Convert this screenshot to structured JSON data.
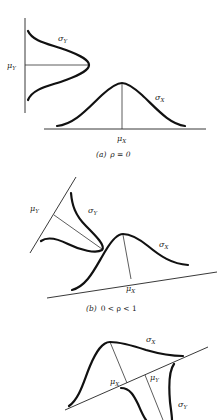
{
  "figure_a": {
    "caption_letter": "(a)",
    "caption_condition": "ρ = 0",
    "labels": {
      "mu_y": "μ",
      "mu_y_sub": "Y",
      "sigma_y": "σ",
      "sigma_y_sub": "Y",
      "mu_x": "μ",
      "mu_x_sub": "X",
      "sigma_x": "σ",
      "sigma_x_sub": "X"
    }
  },
  "figure_b": {
    "caption_letter": "(b)",
    "caption_condition": "0 < ρ < 1",
    "labels": {
      "mu_y": "μ",
      "mu_y_sub": "Y",
      "sigma_y": "σ",
      "sigma_y_sub": "Y",
      "mu_x": "μ",
      "mu_x_sub": "X",
      "sigma_x": "σ",
      "sigma_x_sub": "X"
    }
  },
  "figure_c": {
    "labels": {
      "mu_x": "μ",
      "mu_x_sub": "X",
      "mu_y": "μ",
      "mu_y_sub": "Y",
      "sigma_x": "σ",
      "sigma_x_sub": "X",
      "sigma_y": "σ",
      "sigma_y_sub": "Y"
    }
  }
}
